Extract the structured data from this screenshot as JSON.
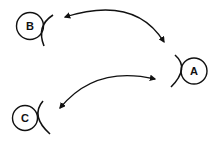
{
  "diagram": {
    "nodes": [
      {
        "id": "B",
        "label": "B",
        "cx": 30,
        "cy": 26,
        "r": 14
      },
      {
        "id": "A",
        "label": "A",
        "cx": 195,
        "cy": 71,
        "r": 13
      },
      {
        "id": "C",
        "label": "C",
        "cx": 25,
        "cy": 118,
        "r": 13
      }
    ],
    "edges": [
      {
        "from": "B",
        "to": "A",
        "type": "bidirectional-arrow"
      },
      {
        "from": "C",
        "to": "A",
        "type": "bidirectional-arrow"
      }
    ],
    "colors": {
      "stroke": "#111111",
      "background": "#ffffff"
    }
  }
}
